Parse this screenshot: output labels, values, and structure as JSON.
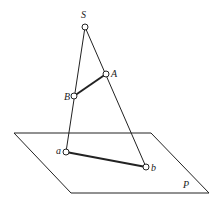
{
  "diagram": {
    "title": "",
    "colors": {
      "line": "#222222",
      "background": "#ffffff",
      "point_fill": "#ffffff"
    },
    "plane": {
      "label": "P",
      "corners": [
        [
          14,
          133
        ],
        [
          151,
          133
        ],
        [
          209,
          193
        ],
        [
          71,
          193
        ]
      ],
      "label_pos": [
        186,
        188
      ]
    },
    "points": [
      {
        "id": "S",
        "label": "S",
        "x": 85,
        "y": 27,
        "label_x": 83,
        "label_y": 18
      },
      {
        "id": "A",
        "label": "A",
        "x": 106,
        "y": 74,
        "label_x": 111,
        "label_y": 77
      },
      {
        "id": "B",
        "label": "B",
        "x": 74,
        "y": 96,
        "label_x": 64,
        "label_y": 100
      },
      {
        "id": "a",
        "label": "a",
        "x": 66,
        "y": 152,
        "label_x": 56,
        "label_y": 153
      },
      {
        "id": "b",
        "label": "b",
        "x": 146,
        "y": 167,
        "label_x": 151,
        "label_y": 171
      }
    ],
    "segments": [
      {
        "from": "S",
        "to": "a",
        "weight": "thin"
      },
      {
        "from": "S",
        "to": "b",
        "weight": "thin"
      },
      {
        "from": "A",
        "to": "B",
        "weight": "thick"
      },
      {
        "from": "a",
        "to": "b",
        "weight": "thick"
      }
    ]
  }
}
